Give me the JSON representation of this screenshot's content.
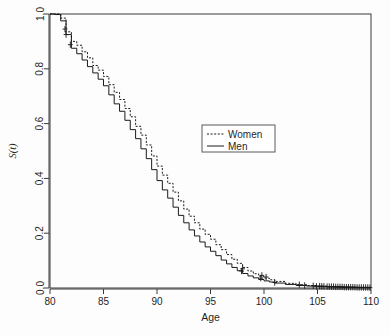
{
  "chart_data": {
    "type": "line",
    "title": "",
    "subtitle": "",
    "xlabel": "Age",
    "ylabel": "S(t)",
    "xlim": [
      80,
      110
    ],
    "ylim": [
      0.0,
      1.0
    ],
    "grid": false,
    "legend_position": "center-right",
    "xticks": [
      "80",
      "85",
      "90",
      "95",
      "100",
      "105",
      "110"
    ],
    "xtick_values": [
      80,
      85,
      90,
      95,
      100,
      105,
      110
    ],
    "yticks": [
      "0.0",
      "0.2",
      "0.4",
      "0.6",
      "0.8",
      "1.0"
    ],
    "ytick_values": [
      0.0,
      0.2,
      0.4,
      0.6,
      0.8,
      1.0
    ],
    "x": [
      80,
      80.5,
      81,
      81.5,
      82,
      82.5,
      83,
      83.5,
      84,
      84.5,
      85,
      85.5,
      86,
      86.5,
      87,
      87.5,
      88,
      88.5,
      89,
      89.5,
      90,
      90.5,
      91,
      91.5,
      92,
      92.5,
      93,
      93.5,
      94,
      94.5,
      95,
      95.5,
      96,
      96.5,
      97,
      97.5,
      98,
      98.5,
      99,
      99.5,
      100,
      100.5,
      101,
      102,
      103,
      104,
      105,
      106,
      107,
      108,
      109,
      110
    ],
    "series": [
      {
        "name": "Women",
        "style": "dotted",
        "color": "#1a1a1a",
        "values": [
          1.0,
          1.0,
          0.985,
          0.935,
          0.9,
          0.886,
          0.862,
          0.84,
          0.812,
          0.795,
          0.772,
          0.742,
          0.714,
          0.688,
          0.655,
          0.625,
          0.59,
          0.558,
          0.522,
          0.482,
          0.445,
          0.412,
          0.382,
          0.35,
          0.318,
          0.288,
          0.262,
          0.238,
          0.215,
          0.196,
          0.178,
          0.158,
          0.14,
          0.122,
          0.105,
          0.09,
          0.075,
          0.062,
          0.052,
          0.043,
          0.036,
          0.03,
          0.024,
          0.017,
          0.012,
          0.009,
          0.007,
          0.005,
          0.004,
          0.003,
          0.002,
          0.002
        ]
      },
      {
        "name": "Men",
        "style": "solid",
        "color": "#1a1a1a",
        "values": [
          1.0,
          0.998,
          0.975,
          0.925,
          0.875,
          0.855,
          0.832,
          0.808,
          0.785,
          0.762,
          0.738,
          0.705,
          0.672,
          0.645,
          0.612,
          0.578,
          0.545,
          0.508,
          0.472,
          0.432,
          0.392,
          0.358,
          0.328,
          0.295,
          0.265,
          0.238,
          0.212,
          0.19,
          0.168,
          0.15,
          0.134,
          0.118,
          0.102,
          0.088,
          0.075,
          0.063,
          0.053,
          0.044,
          0.037,
          0.031,
          0.026,
          0.022,
          0.018,
          0.013,
          0.009,
          0.007,
          0.005,
          0.004,
          0.003,
          0.002,
          0.002,
          0.001
        ]
      }
    ],
    "censor_marks": {
      "Women": [
        {
          "x": 81.4,
          "y": 0.945
        },
        {
          "x": 98.0,
          "y": 0.07
        },
        {
          "x": 99.8,
          "y": 0.046
        },
        {
          "x": 100.2,
          "y": 0.04
        },
        {
          "x": 103.3,
          "y": 0.012
        },
        {
          "x": 104.6,
          "y": 0.008
        },
        {
          "x": 105.2,
          "y": 0.007
        },
        {
          "x": 105.6,
          "y": 0.006
        },
        {
          "x": 106.1,
          "y": 0.005
        },
        {
          "x": 106.5,
          "y": 0.005
        },
        {
          "x": 106.9,
          "y": 0.004
        },
        {
          "x": 107.3,
          "y": 0.004
        },
        {
          "x": 107.7,
          "y": 0.003
        },
        {
          "x": 108.1,
          "y": 0.003
        },
        {
          "x": 108.5,
          "y": 0.003
        },
        {
          "x": 108.9,
          "y": 0.002
        },
        {
          "x": 109.3,
          "y": 0.002
        },
        {
          "x": 109.7,
          "y": 0.002
        }
      ],
      "Men": [
        {
          "x": 81.5,
          "y": 0.925
        },
        {
          "x": 81.9,
          "y": 0.888
        },
        {
          "x": 97.9,
          "y": 0.062
        },
        {
          "x": 99.7,
          "y": 0.036
        },
        {
          "x": 101.0,
          "y": 0.02
        },
        {
          "x": 103.8,
          "y": 0.009
        },
        {
          "x": 104.9,
          "y": 0.006
        },
        {
          "x": 105.4,
          "y": 0.006
        },
        {
          "x": 105.9,
          "y": 0.005
        },
        {
          "x": 106.3,
          "y": 0.005
        },
        {
          "x": 106.7,
          "y": 0.004
        },
        {
          "x": 107.1,
          "y": 0.004
        },
        {
          "x": 107.5,
          "y": 0.003
        },
        {
          "x": 107.9,
          "y": 0.003
        },
        {
          "x": 108.3,
          "y": 0.003
        },
        {
          "x": 108.7,
          "y": 0.002
        },
        {
          "x": 109.1,
          "y": 0.002
        },
        {
          "x": 109.5,
          "y": 0.002
        },
        {
          "x": 109.9,
          "y": 0.001
        }
      ]
    }
  },
  "legend": {
    "entries": [
      {
        "label": "Women",
        "style": "dotted"
      },
      {
        "label": "Men",
        "style": "solid"
      }
    ]
  }
}
